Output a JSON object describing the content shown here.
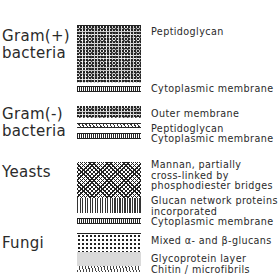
{
  "diagram": {
    "type": "cell-wall-structure-comparison",
    "groups": [
      {
        "name": "Gram(+)\nbacteria",
        "line1": "Gram(+)",
        "line2": "bacteria",
        "layers": [
          {
            "label": "Peptidoglycan",
            "pattern": "speckle"
          },
          {
            "label": "Cytoplasmic membrane",
            "pattern": "membrane"
          }
        ]
      },
      {
        "name": "Gram(-)\nbacteria",
        "line1": "Gram(-)",
        "line2": "bacteria",
        "layers": [
          {
            "label": "Outer membrane",
            "pattern": "speckle"
          },
          {
            "label": "Peptidoglycan",
            "pattern": "thin-hatch"
          },
          {
            "label": "Cytoplasmic membrane",
            "pattern": "membrane"
          }
        ]
      },
      {
        "name": "Yeasts",
        "line1": "Yeasts",
        "layers": [
          {
            "label_lines": [
              "Mannan, partially",
              "cross-linked by",
              "phosphodiester bridges"
            ],
            "pattern": "crosshatch"
          },
          {
            "label_lines": [
              "Glucan network proteins",
              "incorporated"
            ],
            "pattern": "vertical"
          },
          {
            "label": "Cytoplasmic membrane",
            "pattern": "membrane"
          }
        ]
      },
      {
        "name": "Fungi",
        "line1": "Fungi",
        "layers": [
          {
            "label": "Mixed α- and β-glucans",
            "pattern": "dots"
          },
          {
            "label": "Glycoprotein layer",
            "pattern": "fine-stipple"
          },
          {
            "label": "Chitin / microfibrils",
            "pattern": "fibril"
          }
        ]
      }
    ]
  }
}
